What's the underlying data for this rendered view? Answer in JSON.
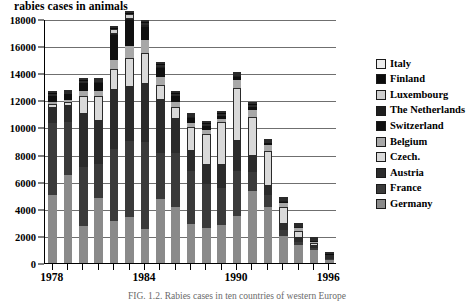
{
  "chart_data": {
    "type": "bar",
    "title": "rabies cases in animals",
    "subtitle": "",
    "xlabel": "",
    "ylabel": "",
    "stacked": true,
    "grid": true,
    "legend_position": "right",
    "ylim": [
      0,
      18000
    ],
    "ytick_step": 2000,
    "yticks": [
      0,
      2000,
      4000,
      6000,
      8000,
      10000,
      12000,
      14000,
      16000,
      18000
    ],
    "ytick_labels": [
      "0",
      "2000",
      "4000",
      "6000",
      "8000",
      "10000",
      "12000",
      "14000",
      "16000",
      "18000"
    ],
    "categories": [
      1978,
      1979,
      1980,
      1981,
      1982,
      1983,
      1984,
      1985,
      1986,
      1987,
      1988,
      1989,
      1990,
      1991,
      1992,
      1993,
      1994,
      1995,
      1996
    ],
    "xtick_labels": [
      "1978",
      "1984",
      "1990",
      "1996"
    ],
    "xtick_categories": [
      1978,
      1984,
      1990,
      1996
    ],
    "stack_order_bottom_to_top": [
      "Germany",
      "France",
      "Austria",
      "Czech.",
      "Belgium",
      "Switzerland",
      "The Netherlands",
      "Luxembourg",
      "Finland",
      "Italy"
    ],
    "series": [
      {
        "name": "Germany",
        "color": "#8a8a8a",
        "values": [
          5000,
          6500,
          2700,
          4800,
          3100,
          3400,
          2500,
          4700,
          4100,
          2900,
          2600,
          2800,
          3500,
          5300,
          4100,
          2000,
          1300,
          950,
          200
        ]
      },
      {
        "name": "France",
        "color": "#3a3a3a",
        "values": [
          5300,
          3900,
          4400,
          2500,
          5300,
          5600,
          6400,
          3400,
          4000,
          3900,
          3200,
          2700,
          3300,
          1400,
          900,
          400,
          250,
          150,
          60
        ]
      },
      {
        "name": "Austria",
        "color": "#2b2b2b",
        "values": [
          1100,
          1200,
          3900,
          3200,
          4400,
          4000,
          4300,
          3900,
          2500,
          1500,
          1400,
          1700,
          2200,
          1200,
          700,
          500,
          300,
          150,
          40
        ]
      },
      {
        "name": "Czech.",
        "color": "#d9d9d9",
        "values": [
          300,
          300,
          1300,
          1800,
          1500,
          2100,
          2300,
          1100,
          900,
          1700,
          2300,
          3200,
          3900,
          2900,
          2600,
          1200,
          550,
          250,
          30
        ]
      },
      {
        "name": "Belgium",
        "color": "#a8a8a8",
        "values": [
          150,
          140,
          400,
          380,
          700,
          900,
          950,
          600,
          400,
          350,
          300,
          250,
          600,
          500,
          400,
          300,
          150,
          80,
          20
        ]
      },
      {
        "name": "Switzerland",
        "color": "#101010",
        "values": [
          450,
          400,
          550,
          600,
          1800,
          1900,
          1000,
          700,
          400,
          350,
          300,
          200,
          250,
          200,
          150,
          120,
          70,
          40,
          10
        ]
      },
      {
        "name": "The Netherlands",
        "color": "#1e1e1e",
        "values": [
          40,
          30,
          50,
          60,
          130,
          140,
          110,
          80,
          60,
          50,
          40,
          30,
          40,
          30,
          25,
          20,
          15,
          10,
          5
        ]
      },
      {
        "name": "Luxembourg",
        "color": "#cfcfcf",
        "values": [
          80,
          70,
          100,
          90,
          300,
          320,
          180,
          130,
          100,
          80,
          70,
          50,
          60,
          50,
          40,
          30,
          20,
          10,
          5
        ]
      },
      {
        "name": "Finland",
        "color": "#0b0b0b",
        "values": [
          30,
          25,
          40,
          35,
          100,
          110,
          80,
          50,
          40,
          30,
          25,
          20,
          25,
          20,
          15,
          10,
          8,
          5,
          3
        ]
      },
      {
        "name": "Italy",
        "color": "#ededed",
        "values": [
          30,
          25,
          40,
          35,
          90,
          100,
          70,
          45,
          35,
          25,
          20,
          18,
          22,
          18,
          14,
          10,
          7,
          5,
          2
        ]
      }
    ],
    "totals": [
      12480,
      12580,
      13480,
      13498,
      17420,
      18570,
      17890,
      14705,
      12535,
      10885,
      10255,
      10968,
      13897,
      11618,
      8945,
      4590,
      2670,
      1650,
      375
    ],
    "annotations": []
  },
  "legend": {
    "items": [
      {
        "label": "Italy",
        "swatch": "italy-swatch"
      },
      {
        "label": "Finland",
        "swatch": "finland-swatch"
      },
      {
        "label": "Luxembourg",
        "swatch": "luxembourg-swatch"
      },
      {
        "label": "The Netherlands",
        "swatch": "netherlands-swatch"
      },
      {
        "label": "Switzerland",
        "swatch": "switzerland-swatch"
      },
      {
        "label": "Belgium",
        "swatch": "belgium-swatch"
      },
      {
        "label": "Czech.",
        "swatch": "czech-swatch"
      },
      {
        "label": "Austria",
        "swatch": "austria-swatch"
      },
      {
        "label": "France",
        "swatch": "france-swatch"
      },
      {
        "label": "Germany",
        "swatch": "germany-swatch"
      }
    ]
  },
  "caption": {
    "text": "FIG. 1.2.   Rabies cases in ten countries of western Europe"
  }
}
